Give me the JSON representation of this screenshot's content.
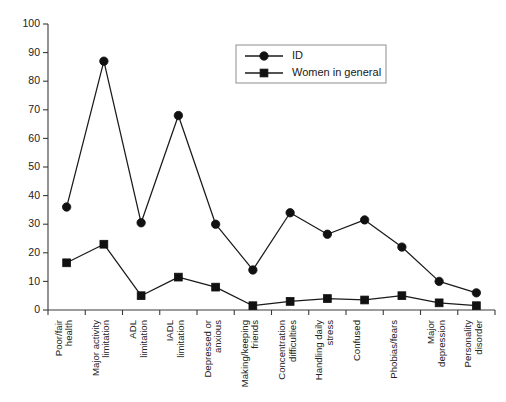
{
  "chart_data": {
    "type": "line",
    "title": "",
    "xlabel": "",
    "ylabel": "",
    "ylim": [
      0,
      100
    ],
    "ytick_step": 10,
    "yticks": [
      0,
      10,
      20,
      30,
      40,
      50,
      60,
      70,
      80,
      90,
      100
    ],
    "grid": false,
    "legend_position": "top-right",
    "categories": [
      "Poor/fair health",
      "Major activity limitation",
      "ADL limitation",
      "IADL limitation",
      "Depressed or anxious",
      "Making/keeping friends",
      "Concentration difficulties",
      "Handling daily stress",
      "Confused",
      "Phobias/fears",
      "Major depression",
      "Personality disorder"
    ],
    "series": [
      {
        "name": "ID",
        "marker": "circle",
        "values": [
          36,
          87,
          30.5,
          68,
          30,
          14,
          34,
          26.5,
          31.5,
          22,
          10,
          6
        ]
      },
      {
        "name": "Women in general",
        "marker": "square",
        "values": [
          16.5,
          23,
          5,
          11.5,
          8,
          1.5,
          3,
          4,
          3.5,
          5,
          2.5,
          1.5
        ]
      }
    ]
  },
  "legend": {
    "entries": [
      {
        "label": "ID",
        "marker": "circle"
      },
      {
        "label": "Women in general",
        "marker": "square"
      }
    ]
  },
  "colors": {
    "series_ink": "#1a1a1a",
    "axis": "#3a3a3a",
    "background": "#ffffff",
    "legend_border": "#8d8d8d"
  }
}
